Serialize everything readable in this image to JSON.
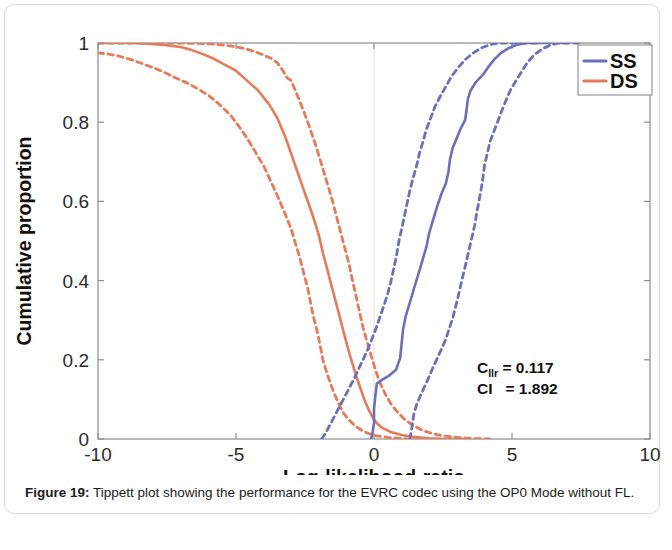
{
  "figure": {
    "caption_label": "Figure 19",
    "caption_sep": ":",
    "caption_text": " Tippett plot showing the performance for the EVRC codec using the OP0 Mode without FL."
  },
  "colors": {
    "ss": "#6B70B8",
    "ds": "#E57B5A",
    "axis": "#8d8d8d",
    "text": "#1b1b1b",
    "card_border": "#d8d8d8"
  },
  "legend": {
    "position": "top-right",
    "items": [
      {
        "label": "SS",
        "color": "#6B70B8",
        "style": "solid"
      },
      {
        "label": "DS",
        "color": "#E57B5A",
        "style": "solid"
      }
    ]
  },
  "annotations": [
    {
      "name": "cllr",
      "symbol": "C",
      "subscript": "llr",
      "equals": "=",
      "value": "0.117"
    },
    {
      "name": "ci",
      "symbol": "CI",
      "subscript": "",
      "equals": "=",
      "value": "1.892"
    }
  ],
  "chart_data": {
    "type": "line",
    "title": "",
    "xlabel": "Log-likelihood-ratio",
    "ylabel": "Cumulative proportion",
    "xlim": [
      -10,
      10
    ],
    "ylim": [
      0,
      1
    ],
    "xticks": [
      -10,
      -5,
      0,
      5,
      10
    ],
    "xticklabels": [
      "-10",
      "-5",
      "0",
      "5",
      "10"
    ],
    "yticks": [
      0,
      0.2,
      0.4,
      0.6,
      0.8,
      1
    ],
    "yticklabels": [
      "0",
      "0.2",
      "0.4",
      "0.6",
      "0.8",
      "1"
    ],
    "grid": false,
    "legend_position": "upper right",
    "reference_line_x": 0,
    "series": [
      {
        "name": "DS",
        "role": "main",
        "color": "#E57B5A",
        "style": "solid",
        "points": [
          [
            -10.0,
            1.0
          ],
          [
            -9.4,
            1.0
          ],
          [
            -8.8,
            1.0
          ],
          [
            -8.2,
            0.998
          ],
          [
            -7.6,
            0.995
          ],
          [
            -7.0,
            0.99
          ],
          [
            -6.6,
            0.982
          ],
          [
            -6.2,
            0.972
          ],
          [
            -5.8,
            0.96
          ],
          [
            -5.4,
            0.945
          ],
          [
            -5.0,
            0.93
          ],
          [
            -4.6,
            0.905
          ],
          [
            -4.2,
            0.88
          ],
          [
            -3.8,
            0.845
          ],
          [
            -3.5,
            0.81
          ],
          [
            -3.2,
            0.76
          ],
          [
            -3.0,
            0.72
          ],
          [
            -2.8,
            0.68
          ],
          [
            -2.6,
            0.64
          ],
          [
            -2.4,
            0.6
          ],
          [
            -2.2,
            0.56
          ],
          [
            -2.0,
            0.515
          ],
          [
            -1.85,
            0.47
          ],
          [
            -1.7,
            0.43
          ],
          [
            -1.55,
            0.39
          ],
          [
            -1.4,
            0.35
          ],
          [
            -1.25,
            0.31
          ],
          [
            -1.1,
            0.27
          ],
          [
            -0.95,
            0.23
          ],
          [
            -0.8,
            0.195
          ],
          [
            -0.65,
            0.16
          ],
          [
            -0.5,
            0.13
          ],
          [
            -0.35,
            0.1
          ],
          [
            -0.2,
            0.075
          ],
          [
            -0.05,
            0.055
          ],
          [
            0.1,
            0.04
          ],
          [
            0.3,
            0.028
          ],
          [
            0.6,
            0.018
          ],
          [
            1.0,
            0.01
          ],
          [
            1.5,
            0.005
          ],
          [
            2.0,
            0.002
          ],
          [
            2.6,
            0.0
          ],
          [
            3.4,
            0.0
          ]
        ]
      },
      {
        "name": "DS lower bound",
        "role": "ci-lower",
        "color": "#E57B5A",
        "style": "dashed",
        "points": [
          [
            -10.0,
            0.975
          ],
          [
            -9.6,
            0.972
          ],
          [
            -9.2,
            0.966
          ],
          [
            -8.8,
            0.958
          ],
          [
            -8.4,
            0.948
          ],
          [
            -8.0,
            0.938
          ],
          [
            -7.6,
            0.926
          ],
          [
            -7.2,
            0.912
          ],
          [
            -6.8,
            0.9
          ],
          [
            -6.4,
            0.885
          ],
          [
            -6.0,
            0.868
          ],
          [
            -5.6,
            0.845
          ],
          [
            -5.2,
            0.818
          ],
          [
            -4.9,
            0.79
          ],
          [
            -4.6,
            0.76
          ],
          [
            -4.3,
            0.725
          ],
          [
            -4.0,
            0.69
          ],
          [
            -3.8,
            0.66
          ],
          [
            -3.6,
            0.63
          ],
          [
            -3.4,
            0.598
          ],
          [
            -3.2,
            0.565
          ],
          [
            -3.0,
            0.53
          ],
          [
            -2.85,
            0.495
          ],
          [
            -2.7,
            0.46
          ],
          [
            -2.55,
            0.42
          ],
          [
            -2.4,
            0.38
          ],
          [
            -2.3,
            0.345
          ],
          [
            -2.2,
            0.31
          ],
          [
            -2.05,
            0.27
          ],
          [
            -1.95,
            0.235
          ],
          [
            -1.85,
            0.2
          ],
          [
            -1.7,
            0.165
          ],
          [
            -1.55,
            0.135
          ],
          [
            -1.4,
            0.108
          ],
          [
            -1.25,
            0.085
          ],
          [
            -1.1,
            0.065
          ],
          [
            -0.9,
            0.048
          ],
          [
            -0.7,
            0.034
          ],
          [
            -0.45,
            0.022
          ],
          [
            -0.2,
            0.014
          ],
          [
            0.1,
            0.008
          ],
          [
            0.5,
            0.004
          ],
          [
            1.0,
            0.001
          ],
          [
            1.6,
            0.0
          ]
        ]
      },
      {
        "name": "DS upper bound",
        "role": "ci-upper",
        "color": "#E57B5A",
        "style": "dashed",
        "points": [
          [
            -10.0,
            1.0
          ],
          [
            -8.5,
            1.0
          ],
          [
            -7.2,
            1.0
          ],
          [
            -6.4,
            0.999
          ],
          [
            -5.8,
            0.997
          ],
          [
            -5.2,
            0.993
          ],
          [
            -4.8,
            0.988
          ],
          [
            -4.4,
            0.98
          ],
          [
            -4.0,
            0.97
          ],
          [
            -3.7,
            0.96
          ],
          [
            -3.5,
            0.95
          ],
          [
            -3.3,
            0.93
          ],
          [
            -3.15,
            0.912
          ],
          [
            -3.0,
            0.905
          ],
          [
            -2.85,
            0.88
          ],
          [
            -2.7,
            0.855
          ],
          [
            -2.55,
            0.828
          ],
          [
            -2.4,
            0.8
          ],
          [
            -2.25,
            0.77
          ],
          [
            -2.1,
            0.74
          ],
          [
            -1.95,
            0.705
          ],
          [
            -1.8,
            0.67
          ],
          [
            -1.65,
            0.635
          ],
          [
            -1.5,
            0.6
          ],
          [
            -1.35,
            0.56
          ],
          [
            -1.2,
            0.52
          ],
          [
            -1.05,
            0.48
          ],
          [
            -0.9,
            0.44
          ],
          [
            -0.78,
            0.4
          ],
          [
            -0.65,
            0.36
          ],
          [
            -0.52,
            0.32
          ],
          [
            -0.4,
            0.282
          ],
          [
            -0.25,
            0.245
          ],
          [
            -0.1,
            0.21
          ],
          [
            0.05,
            0.175
          ],
          [
            0.2,
            0.145
          ],
          [
            0.4,
            0.115
          ],
          [
            0.6,
            0.09
          ],
          [
            0.85,
            0.068
          ],
          [
            1.1,
            0.05
          ],
          [
            1.4,
            0.035
          ],
          [
            1.75,
            0.022
          ],
          [
            2.1,
            0.014
          ],
          [
            2.5,
            0.008
          ],
          [
            3.0,
            0.004
          ],
          [
            3.6,
            0.001
          ],
          [
            4.2,
            0.0
          ]
        ]
      },
      {
        "name": "SS",
        "role": "main",
        "color": "#6B70B8",
        "style": "solid",
        "points": [
          [
            -0.1,
            0.0
          ],
          [
            -0.05,
            0.018
          ],
          [
            0.0,
            0.04
          ],
          [
            0.0,
            0.075
          ],
          [
            0.05,
            0.11
          ],
          [
            0.1,
            0.14
          ],
          [
            0.3,
            0.15
          ],
          [
            0.55,
            0.16
          ],
          [
            0.8,
            0.175
          ],
          [
            0.95,
            0.205
          ],
          [
            1.0,
            0.24
          ],
          [
            1.05,
            0.275
          ],
          [
            1.15,
            0.31
          ],
          [
            1.3,
            0.345
          ],
          [
            1.45,
            0.38
          ],
          [
            1.6,
            0.415
          ],
          [
            1.75,
            0.45
          ],
          [
            1.9,
            0.485
          ],
          [
            2.0,
            0.52
          ],
          [
            2.15,
            0.555
          ],
          [
            2.3,
            0.59
          ],
          [
            2.45,
            0.62
          ],
          [
            2.6,
            0.645
          ],
          [
            2.7,
            0.675
          ],
          [
            2.75,
            0.705
          ],
          [
            2.85,
            0.735
          ],
          [
            3.0,
            0.76
          ],
          [
            3.15,
            0.785
          ],
          [
            3.3,
            0.805
          ],
          [
            3.35,
            0.83
          ],
          [
            3.4,
            0.858
          ],
          [
            3.5,
            0.88
          ],
          [
            3.7,
            0.902
          ],
          [
            3.95,
            0.92
          ],
          [
            4.15,
            0.94
          ],
          [
            4.35,
            0.958
          ],
          [
            4.6,
            0.975
          ],
          [
            4.9,
            0.988
          ],
          [
            5.2,
            0.996
          ],
          [
            5.5,
            1.0
          ],
          [
            6.2,
            1.0
          ],
          [
            7.0,
            1.0
          ]
        ]
      },
      {
        "name": "SS lower bound",
        "role": "ci-lower",
        "color": "#6B70B8",
        "style": "dashed",
        "points": [
          [
            -1.9,
            0.0
          ],
          [
            -1.75,
            0.015
          ],
          [
            -1.6,
            0.035
          ],
          [
            -1.45,
            0.055
          ],
          [
            -1.3,
            0.075
          ],
          [
            -1.15,
            0.095
          ],
          [
            -1.0,
            0.115
          ],
          [
            -0.85,
            0.135
          ],
          [
            -0.7,
            0.155
          ],
          [
            -0.55,
            0.178
          ],
          [
            -0.4,
            0.2
          ],
          [
            -0.25,
            0.222
          ],
          [
            -0.1,
            0.248
          ],
          [
            0.05,
            0.275
          ],
          [
            0.2,
            0.305
          ],
          [
            0.35,
            0.335
          ],
          [
            0.5,
            0.368
          ],
          [
            0.62,
            0.4
          ],
          [
            0.72,
            0.432
          ],
          [
            0.82,
            0.465
          ],
          [
            0.9,
            0.498
          ],
          [
            1.0,
            0.53
          ],
          [
            1.1,
            0.562
          ],
          [
            1.2,
            0.595
          ],
          [
            1.3,
            0.628
          ],
          [
            1.42,
            0.66
          ],
          [
            1.55,
            0.692
          ],
          [
            1.65,
            0.722
          ],
          [
            1.78,
            0.752
          ],
          [
            1.9,
            0.782
          ],
          [
            2.05,
            0.81
          ],
          [
            2.2,
            0.838
          ],
          [
            2.4,
            0.865
          ],
          [
            2.6,
            0.89
          ],
          [
            2.8,
            0.915
          ],
          [
            3.05,
            0.938
          ],
          [
            3.3,
            0.958
          ],
          [
            3.6,
            0.975
          ],
          [
            3.9,
            0.988
          ],
          [
            4.2,
            0.996
          ],
          [
            4.5,
            1.0
          ],
          [
            5.2,
            1.0
          ],
          [
            6.0,
            1.0
          ]
        ]
      },
      {
        "name": "SS upper bound",
        "role": "ci-upper",
        "color": "#6B70B8",
        "style": "dashed",
        "points": [
          [
            1.3,
            0.0
          ],
          [
            1.35,
            0.02
          ],
          [
            1.4,
            0.042
          ],
          [
            1.45,
            0.065
          ],
          [
            1.55,
            0.088
          ],
          [
            1.7,
            0.112
          ],
          [
            1.85,
            0.135
          ],
          [
            2.0,
            0.158
          ],
          [
            2.15,
            0.182
          ],
          [
            2.3,
            0.205
          ],
          [
            2.45,
            0.228
          ],
          [
            2.6,
            0.252
          ],
          [
            2.72,
            0.278
          ],
          [
            2.85,
            0.305
          ],
          [
            2.95,
            0.332
          ],
          [
            3.05,
            0.36
          ],
          [
            3.15,
            0.39
          ],
          [
            3.25,
            0.42
          ],
          [
            3.35,
            0.45
          ],
          [
            3.45,
            0.48
          ],
          [
            3.55,
            0.51
          ],
          [
            3.65,
            0.54
          ],
          [
            3.72,
            0.57
          ],
          [
            3.8,
            0.6
          ],
          [
            3.88,
            0.63
          ],
          [
            3.95,
            0.66
          ],
          [
            4.0,
            0.69
          ],
          [
            4.1,
            0.72
          ],
          [
            4.2,
            0.75
          ],
          [
            4.35,
            0.778
          ],
          [
            4.5,
            0.805
          ],
          [
            4.65,
            0.832
          ],
          [
            4.8,
            0.858
          ],
          [
            4.95,
            0.882
          ],
          [
            5.15,
            0.905
          ],
          [
            5.35,
            0.928
          ],
          [
            5.55,
            0.95
          ],
          [
            5.8,
            0.97
          ],
          [
            6.1,
            0.985
          ],
          [
            6.4,
            0.995
          ],
          [
            6.7,
            1.0
          ],
          [
            7.4,
            1.0
          ]
        ]
      }
    ]
  }
}
